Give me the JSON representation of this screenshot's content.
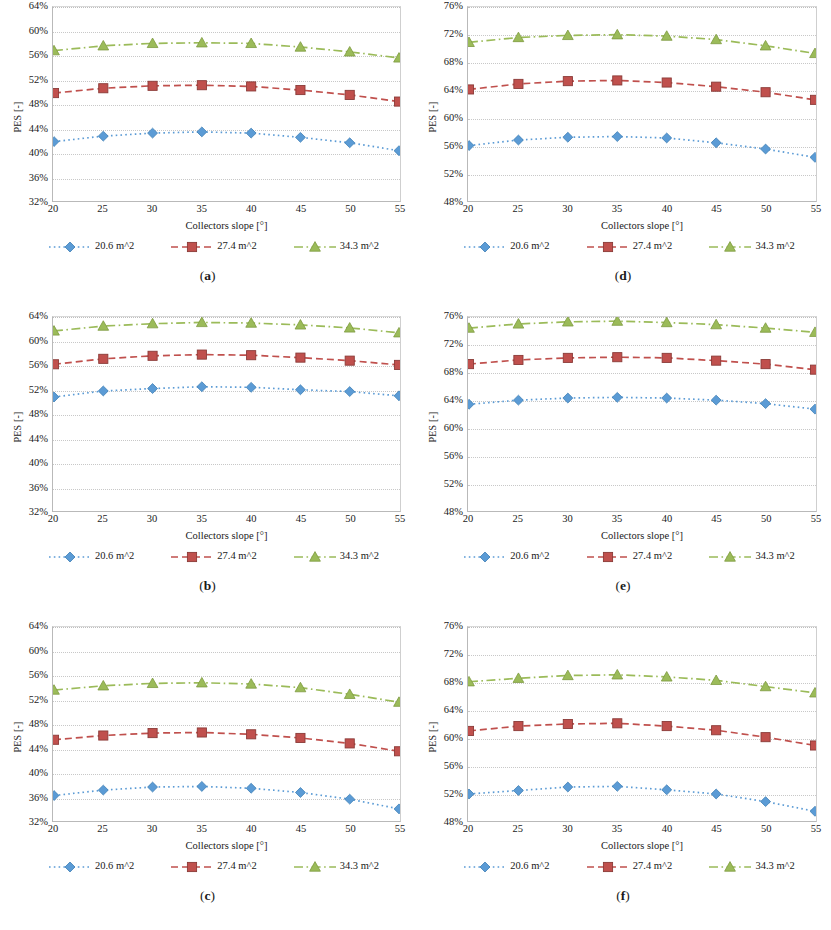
{
  "figure": {
    "panels": [
      {
        "id": "a",
        "caption": "(a)",
        "position": "top-left"
      },
      {
        "id": "b",
        "caption": "(b)",
        "position": "middle-left"
      },
      {
        "id": "c",
        "caption": "(c)",
        "position": "bottom-left"
      },
      {
        "id": "d",
        "caption": "(d)",
        "position": "top-right"
      },
      {
        "id": "e",
        "caption": "(e)",
        "position": "middle-right"
      },
      {
        "id": "f",
        "caption": "(f)",
        "position": "bottom-right"
      }
    ]
  },
  "colors": {
    "series_20_6": "#5B9BD5",
    "series_27_4": "#C0504D",
    "series_34_3": "#9BBB59",
    "gridline": "#c8c8c8",
    "axis": "#b9b9b9",
    "text": "#1a1a1a"
  },
  "legend": {
    "items": [
      {
        "label": "20.6 m^2",
        "marker": "diamond",
        "dash": "dotted",
        "color": "#5B9BD5"
      },
      {
        "label": "27.4 m^2",
        "marker": "square",
        "dash": "dashed",
        "color": "#C0504D"
      },
      {
        "label": "34.3 m^2",
        "marker": "triangle",
        "dash": "dash-dot",
        "color": "#9BBB59"
      }
    ]
  },
  "chart_data": [
    {
      "panel": "a",
      "type": "line",
      "title": "",
      "xlabel": "Collectors slope [°]",
      "ylabel": "PES [-]",
      "x": [
        20,
        25,
        30,
        35,
        40,
        45,
        50,
        55
      ],
      "xtick_labels": [
        "20",
        "25",
        "30",
        "35",
        "40",
        "45",
        "50",
        "55"
      ],
      "xlim": [
        20,
        55
      ],
      "ylim": [
        0.32,
        0.64
      ],
      "ytick_values": [
        0.32,
        0.36,
        0.4,
        0.44,
        0.48,
        0.52,
        0.56,
        0.6,
        0.64
      ],
      "ytick_labels": [
        "32%",
        "36%",
        "40%",
        "44%",
        "48%",
        "52%",
        "56%",
        "60%",
        "64%"
      ],
      "grid": true,
      "legend_position": "below",
      "series": [
        {
          "name": "20.6 m^2",
          "color": "#5B9BD5",
          "marker": "diamond",
          "dash": "dotted",
          "values": [
            0.418,
            0.427,
            0.432,
            0.434,
            0.432,
            0.425,
            0.416,
            0.403
          ]
        },
        {
          "name": "27.4 m^2",
          "color": "#C0504D",
          "marker": "square",
          "dash": "dashed",
          "values": [
            0.498,
            0.506,
            0.51,
            0.511,
            0.509,
            0.503,
            0.495,
            0.484
          ]
        },
        {
          "name": "34.3 m^2",
          "color": "#9BBB59",
          "marker": "triangle",
          "dash": "dash-dot",
          "values": [
            0.568,
            0.576,
            0.58,
            0.581,
            0.58,
            0.574,
            0.566,
            0.556
          ]
        }
      ]
    },
    {
      "panel": "b",
      "type": "line",
      "title": "",
      "xlabel": "Collectors slope [°]",
      "ylabel": "PES [-]",
      "x": [
        20,
        25,
        30,
        35,
        40,
        45,
        50,
        55
      ],
      "xtick_labels": [
        "20",
        "25",
        "30",
        "35",
        "40",
        "45",
        "50",
        "55"
      ],
      "xlim": [
        20,
        55
      ],
      "ylim": [
        0.32,
        0.64
      ],
      "ytick_values": [
        0.32,
        0.36,
        0.4,
        0.44,
        0.48,
        0.52,
        0.56,
        0.6,
        0.64
      ],
      "ytick_labels": [
        "32%",
        "36%",
        "40%",
        "44%",
        "48%",
        "52%",
        "56%",
        "60%",
        "64%"
      ],
      "grid": true,
      "legend_position": "below",
      "series": [
        {
          "name": "20.6 m^2",
          "color": "#5B9BD5",
          "marker": "diamond",
          "dash": "dotted",
          "values": [
            0.508,
            0.518,
            0.522,
            0.525,
            0.524,
            0.52,
            0.517,
            0.51
          ]
        },
        {
          "name": "27.4 m^2",
          "color": "#C0504D",
          "marker": "square",
          "dash": "dashed",
          "values": [
            0.562,
            0.571,
            0.576,
            0.578,
            0.577,
            0.573,
            0.568,
            0.561
          ]
        },
        {
          "name": "34.3 m^2",
          "color": "#9BBB59",
          "marker": "triangle",
          "dash": "dash-dot",
          "values": [
            0.617,
            0.625,
            0.629,
            0.631,
            0.63,
            0.627,
            0.622,
            0.614
          ]
        }
      ]
    },
    {
      "panel": "c",
      "type": "line",
      "title": "",
      "xlabel": "Collectors slope [°]",
      "ylabel": "PES [-]",
      "x": [
        20,
        25,
        30,
        35,
        40,
        45,
        50,
        55
      ],
      "xtick_labels": [
        "20",
        "25",
        "30",
        "35",
        "40",
        "45",
        "50",
        "55"
      ],
      "xlim": [
        20,
        55
      ],
      "ylim": [
        0.32,
        0.64
      ],
      "ytick_values": [
        0.32,
        0.36,
        0.4,
        0.44,
        0.48,
        0.52,
        0.56,
        0.6,
        0.64
      ],
      "ytick_labels": [
        "32%",
        "36%",
        "40%",
        "44%",
        "48%",
        "52%",
        "56%",
        "60%",
        "64%"
      ],
      "grid": true,
      "legend_position": "below",
      "series": [
        {
          "name": "20.6 m^2",
          "color": "#5B9BD5",
          "marker": "diamond",
          "dash": "dotted",
          "values": [
            0.362,
            0.371,
            0.376,
            0.377,
            0.374,
            0.367,
            0.356,
            0.34
          ]
        },
        {
          "name": "27.4 m^2",
          "color": "#C0504D",
          "marker": "square",
          "dash": "dashed",
          "values": [
            0.454,
            0.461,
            0.465,
            0.466,
            0.463,
            0.457,
            0.448,
            0.435
          ]
        },
        {
          "name": "34.3 m^2",
          "color": "#9BBB59",
          "marker": "triangle",
          "dash": "dash-dot",
          "values": [
            0.536,
            0.543,
            0.547,
            0.548,
            0.546,
            0.54,
            0.529,
            0.516
          ]
        }
      ]
    },
    {
      "panel": "d",
      "type": "line",
      "title": "",
      "xlabel": "Collectors slope [°]",
      "ylabel": "PES [-]",
      "x": [
        20,
        25,
        30,
        35,
        40,
        45,
        50,
        55
      ],
      "xtick_labels": [
        "20",
        "25",
        "30",
        "35",
        "40",
        "45",
        "50",
        "55"
      ],
      "xlim": [
        20,
        55
      ],
      "ylim": [
        0.48,
        0.76
      ],
      "ytick_values": [
        0.48,
        0.52,
        0.56,
        0.6,
        0.64,
        0.68,
        0.72,
        0.76
      ],
      "ytick_labels": [
        "48%",
        "52%",
        "56%",
        "60%",
        "64%",
        "68%",
        "72%",
        "76%"
      ],
      "grid": true,
      "legend_position": "below",
      "series": [
        {
          "name": "20.6 m^2",
          "color": "#5B9BD5",
          "marker": "diamond",
          "dash": "dotted",
          "values": [
            0.56,
            0.568,
            0.572,
            0.573,
            0.571,
            0.564,
            0.555,
            0.543
          ]
        },
        {
          "name": "27.4 m^2",
          "color": "#C0504D",
          "marker": "square",
          "dash": "dashed",
          "values": [
            0.641,
            0.649,
            0.653,
            0.654,
            0.651,
            0.645,
            0.637,
            0.626
          ]
        },
        {
          "name": "34.3 m^2",
          "color": "#9BBB59",
          "marker": "triangle",
          "dash": "dash-dot",
          "values": [
            0.709,
            0.716,
            0.719,
            0.72,
            0.718,
            0.713,
            0.704,
            0.693
          ]
        }
      ]
    },
    {
      "panel": "e",
      "type": "line",
      "title": "",
      "xlabel": "Collectors slope [°]",
      "ylabel": "PES [-]",
      "x": [
        20,
        25,
        30,
        35,
        40,
        45,
        50,
        55
      ],
      "xtick_labels": [
        "20",
        "25",
        "30",
        "35",
        "40",
        "45",
        "50",
        "55"
      ],
      "xlim": [
        20,
        55
      ],
      "ylim": [
        0.48,
        0.76
      ],
      "ytick_values": [
        0.48,
        0.52,
        0.56,
        0.6,
        0.64,
        0.68,
        0.72,
        0.76
      ],
      "ytick_labels": [
        "48%",
        "52%",
        "56%",
        "60%",
        "64%",
        "68%",
        "72%",
        "76%"
      ],
      "grid": true,
      "legend_position": "below",
      "series": [
        {
          "name": "20.6 m^2",
          "color": "#5B9BD5",
          "marker": "diamond",
          "dash": "dotted",
          "values": [
            0.634,
            0.64,
            0.643,
            0.644,
            0.643,
            0.64,
            0.635,
            0.627
          ]
        },
        {
          "name": "27.4 m^2",
          "color": "#C0504D",
          "marker": "square",
          "dash": "dashed",
          "values": [
            0.692,
            0.698,
            0.701,
            0.702,
            0.701,
            0.697,
            0.692,
            0.684
          ]
        },
        {
          "name": "34.3 m^2",
          "color": "#9BBB59",
          "marker": "triangle",
          "dash": "dash-dot",
          "values": [
            0.744,
            0.75,
            0.753,
            0.754,
            0.752,
            0.749,
            0.744,
            0.738
          ]
        }
      ]
    },
    {
      "panel": "f",
      "type": "line",
      "title": "",
      "xlabel": "Collectors slope [°]",
      "ylabel": "PES [-]",
      "x": [
        20,
        25,
        30,
        35,
        40,
        45,
        50,
        55
      ],
      "xtick_labels": [
        "20",
        "25",
        "30",
        "35",
        "40",
        "45",
        "50",
        "55"
      ],
      "xlim": [
        20,
        55
      ],
      "ylim": [
        0.48,
        0.76
      ],
      "ytick_values": [
        0.48,
        0.52,
        0.56,
        0.6,
        0.64,
        0.68,
        0.72,
        0.76
      ],
      "ytick_labels": [
        "48%",
        "52%",
        "56%",
        "60%",
        "64%",
        "68%",
        "72%",
        "76%"
      ],
      "grid": true,
      "legend_position": "below",
      "series": [
        {
          "name": "20.6 m^2",
          "color": "#5B9BD5",
          "marker": "diamond",
          "dash": "dotted",
          "values": [
            0.519,
            0.524,
            0.529,
            0.53,
            0.525,
            0.519,
            0.508,
            0.494
          ]
        },
        {
          "name": "27.4 m^2",
          "color": "#C0504D",
          "marker": "square",
          "dash": "dashed",
          "values": [
            0.61,
            0.617,
            0.62,
            0.621,
            0.617,
            0.611,
            0.601,
            0.589
          ]
        },
        {
          "name": "34.3 m^2",
          "color": "#9BBB59",
          "marker": "triangle",
          "dash": "dash-dot",
          "values": [
            0.681,
            0.686,
            0.69,
            0.691,
            0.688,
            0.683,
            0.674,
            0.665
          ]
        }
      ]
    }
  ]
}
